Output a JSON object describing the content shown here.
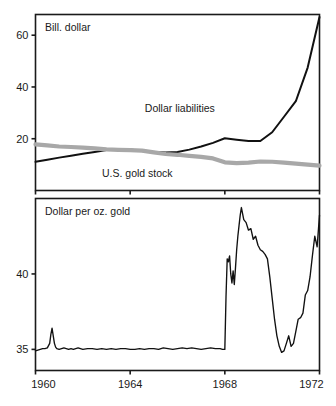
{
  "figure": {
    "background_color": "#ffffff",
    "line_color_black": "#111111",
    "line_color_gray": "#a8a8a8",
    "axis_color": "#1a1a1a"
  },
  "chart_data": [
    {
      "type": "line",
      "panel": "top",
      "title": "Bill. dollar",
      "xlabel": "",
      "ylabel": "Bill. dollar",
      "xlim": [
        1960,
        1972
      ],
      "ylim": [
        0,
        68
      ],
      "yticks": [
        20,
        40,
        60
      ],
      "ytick_labels": [
        "20",
        "40",
        "60"
      ],
      "xticks": [
        1960,
        1964,
        1968,
        1972
      ],
      "xtick_labels": [
        "",
        "",
        "",
        ""
      ],
      "grid": false,
      "legend_position": "inline-annotation",
      "series": [
        {
          "name": "Dollar liabilities",
          "color": "#111111",
          "style": "solid-black",
          "label_x": 1966.1,
          "label_y": 30.5,
          "x": [
            1960,
            1960.5,
            1961,
            1961.5,
            1962,
            1962.5,
            1963,
            1963.5,
            1964,
            1964.5,
            1965,
            1965.5,
            1966,
            1966.5,
            1967,
            1967.5,
            1968,
            1968.5,
            1969,
            1969.5,
            1970,
            1970.5,
            1971,
            1971.5,
            1972
          ],
          "values": [
            11.1,
            11.9,
            12.7,
            13.4,
            14.2,
            14.9,
            15.6,
            15.9,
            15.8,
            15.3,
            14.9,
            14.7,
            14.9,
            15.8,
            17.0,
            18.4,
            20.2,
            19.6,
            19.1,
            19.1,
            22.5,
            28.5,
            34.5,
            47.5,
            67.0
          ]
        },
        {
          "name": "U.S. gold stock",
          "color": "#a8a8a8",
          "style": "thick-gray",
          "label_x": 1964.3,
          "label_y": 5.2,
          "x": [
            1960,
            1960.5,
            1961,
            1961.5,
            1962,
            1962.5,
            1963,
            1963.5,
            1964,
            1964.5,
            1965,
            1965.5,
            1966,
            1966.5,
            1967,
            1967.5,
            1968,
            1968.5,
            1969,
            1969.5,
            1970,
            1970.5,
            1971,
            1971.5,
            1972
          ],
          "values": [
            17.8,
            17.4,
            17.0,
            16.8,
            16.6,
            16.3,
            15.9,
            15.7,
            15.6,
            15.4,
            14.7,
            14.1,
            13.8,
            13.4,
            13.0,
            12.4,
            10.9,
            10.6,
            10.8,
            11.2,
            11.1,
            10.8,
            10.4,
            10.0,
            9.6
          ]
        }
      ]
    },
    {
      "type": "line",
      "panel": "bottom",
      "title": "Dollar per oz. gold",
      "xlabel": "",
      "ylabel": "Dollar per oz. gold",
      "xlim": [
        1960,
        1972
      ],
      "ylim": [
        33.6,
        45.0
      ],
      "yticks": [
        35,
        40
      ],
      "ytick_labels": [
        "35",
        "40"
      ],
      "xticks": [
        1960,
        1964,
        1968,
        1972
      ],
      "xtick_labels": [
        "1960",
        "1964",
        "1968",
        "1972"
      ],
      "grid": false,
      "legend_position": "none",
      "series": [
        {
          "name": "Dollar per oz. gold",
          "color": "#111111",
          "style": "solid-thin",
          "x": [
            1960.0,
            1960.1,
            1960.2,
            1960.3,
            1960.4,
            1960.5,
            1960.6,
            1960.65,
            1960.7,
            1960.75,
            1960.8,
            1960.85,
            1960.9,
            1961.0,
            1961.1,
            1961.2,
            1961.3,
            1961.4,
            1961.5,
            1961.6,
            1961.7,
            1961.8,
            1961.9,
            1962.0,
            1962.2,
            1962.4,
            1962.6,
            1962.8,
            1963.0,
            1963.2,
            1963.4,
            1963.6,
            1963.8,
            1964.0,
            1964.2,
            1964.4,
            1964.6,
            1964.8,
            1965.0,
            1965.2,
            1965.4,
            1965.6,
            1965.8,
            1966.0,
            1966.2,
            1966.4,
            1966.6,
            1966.8,
            1967.0,
            1967.2,
            1967.4,
            1967.6,
            1967.8,
            1967.9,
            1968.0,
            1968.05,
            1968.1,
            1968.15,
            1968.2,
            1968.25,
            1968.3,
            1968.35,
            1968.4,
            1968.45,
            1968.5,
            1968.55,
            1968.6,
            1968.65,
            1968.7,
            1968.8,
            1968.9,
            1969.0,
            1969.1,
            1969.2,
            1969.3,
            1969.4,
            1969.5,
            1969.6,
            1969.7,
            1969.8,
            1969.9,
            1970.0,
            1970.1,
            1970.2,
            1970.3,
            1970.4,
            1970.5,
            1970.6,
            1970.7,
            1970.8,
            1970.9,
            1971.0,
            1971.1,
            1971.2,
            1971.3,
            1971.4,
            1971.5,
            1971.6,
            1971.7,
            1971.8,
            1971.9,
            1972.0
          ],
          "values": [
            34.9,
            34.95,
            35.0,
            35.05,
            35.05,
            35.1,
            35.4,
            36.0,
            36.4,
            35.9,
            35.4,
            35.15,
            35.05,
            35.0,
            35.05,
            35.1,
            35.05,
            35.0,
            35.05,
            35.0,
            35.05,
            35.1,
            35.05,
            35.0,
            35.05,
            35.05,
            35.0,
            35.05,
            35.0,
            35.05,
            35.0,
            35.05,
            35.05,
            35.0,
            35.0,
            35.05,
            35.0,
            35.05,
            35.05,
            35.0,
            35.1,
            35.05,
            35.0,
            35.05,
            35.1,
            35.05,
            35.1,
            35.05,
            35.0,
            35.05,
            35.1,
            35.05,
            35.05,
            35.0,
            35.0,
            38.5,
            41.0,
            40.8,
            41.2,
            40.0,
            39.4,
            40.2,
            39.3,
            40.4,
            41.6,
            42.5,
            43.2,
            43.9,
            44.4,
            43.6,
            43.4,
            42.9,
            43.0,
            42.3,
            42.5,
            41.9,
            41.6,
            41.5,
            41.3,
            41.0,
            39.8,
            38.4,
            37.0,
            35.9,
            35.2,
            34.8,
            34.9,
            35.4,
            35.9,
            35.2,
            35.4,
            36.2,
            37.0,
            37.1,
            37.4,
            38.6,
            38.9,
            39.8,
            41.2,
            42.5,
            41.8,
            43.9
          ]
        }
      ]
    }
  ]
}
